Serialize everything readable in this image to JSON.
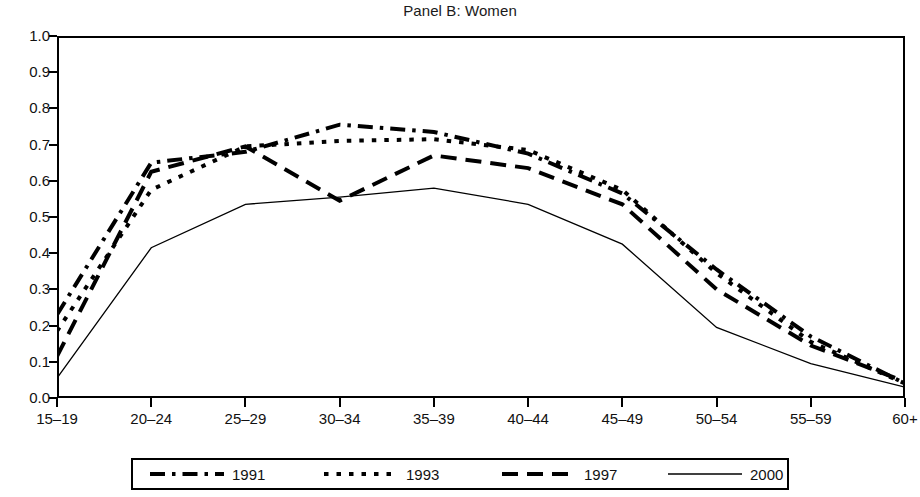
{
  "chart_data": {
    "type": "line",
    "title": "Panel B: Women",
    "xlabel": "",
    "ylabel": "",
    "categories": [
      "15–19",
      "20–24",
      "25–29",
      "30–34",
      "35–39",
      "40–44",
      "45–49",
      "50–54",
      "55–59",
      "60+"
    ],
    "ylim": [
      0.0,
      1.0
    ],
    "ytick_labels": [
      "0.0",
      "0.1",
      "0.2",
      "0.3",
      "0.4",
      "0.5",
      "0.6",
      "0.7",
      "0.8",
      "0.9",
      "1.0"
    ],
    "ytick_values": [
      0.0,
      0.1,
      0.2,
      0.3,
      0.4,
      0.5,
      0.6,
      0.7,
      0.8,
      0.9,
      1.0
    ],
    "grid": false,
    "legend_position": "bottom",
    "series": [
      {
        "name": "1991",
        "style": "dash-dot",
        "color": "#000000",
        "values": [
          0.23,
          0.65,
          0.68,
          0.755,
          0.735,
          0.675,
          0.565,
          0.355,
          0.17,
          0.04
        ]
      },
      {
        "name": "1993",
        "style": "dotted",
        "color": "#000000",
        "values": [
          0.185,
          0.575,
          0.695,
          0.71,
          0.715,
          0.685,
          0.575,
          0.345,
          0.155,
          0.04
        ]
      },
      {
        "name": "1997",
        "style": "dashed",
        "color": "#000000",
        "values": [
          0.115,
          0.625,
          0.695,
          0.545,
          0.67,
          0.635,
          0.535,
          0.3,
          0.145,
          0.045
        ]
      },
      {
        "name": "2000",
        "style": "solid",
        "color": "#000000",
        "values": [
          0.055,
          0.415,
          0.535,
          0.555,
          0.58,
          0.535,
          0.425,
          0.195,
          0.095,
          0.03
        ]
      }
    ]
  },
  "legend": {
    "entries": [
      {
        "label": "1991",
        "style": "dash-dot"
      },
      {
        "label": "1993",
        "style": "dotted"
      },
      {
        "label": "1997",
        "style": "dashed"
      },
      {
        "label": "2000",
        "style": "solid"
      }
    ]
  }
}
